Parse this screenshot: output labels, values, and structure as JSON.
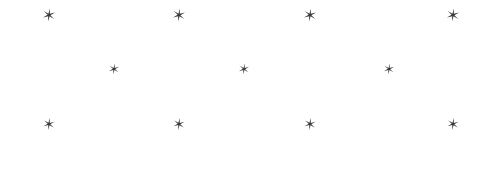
{
  "canvas": {
    "width": 502,
    "height": 176,
    "background_color": "#ffffff",
    "glyph_color": "#3a3a3a"
  },
  "pattern": {
    "name": "staggered-star-lattice",
    "icon_name": "star-icon",
    "glyph_character": "✶",
    "total_count": 11,
    "row_count": 3,
    "rows": [
      {
        "row_index": 0,
        "y": 15,
        "count": 4,
        "glyph_size": 13,
        "x_positions": [
          49,
          179,
          310,
          453
        ]
      },
      {
        "row_index": 1,
        "y": 69,
        "count": 3,
        "glyph_size": 11,
        "x_positions": [
          114,
          244,
          389
        ]
      },
      {
        "row_index": 2,
        "y": 124,
        "count": 4,
        "glyph_size": 12,
        "x_positions": [
          49,
          179,
          310,
          453
        ]
      }
    ]
  }
}
